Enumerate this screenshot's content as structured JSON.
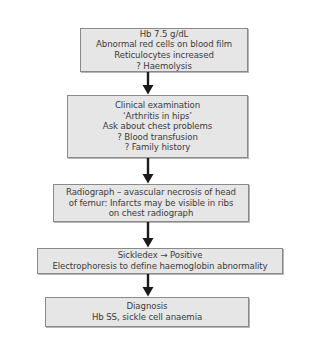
{
  "flowchart": {
    "steps": [
      {
        "id": "initial-findings",
        "lines": [
          "Hb 7.5 g/dL",
          "Abnormal red cells on blood film",
          "Reticulocytes increased",
          "? Haemolysis"
        ]
      },
      {
        "id": "clinical-examination",
        "lines": [
          "Clinical examination",
          "‘Arthritis in hips’",
          "Ask about chest problems",
          "? Blood transfusion",
          "? Family history"
        ]
      },
      {
        "id": "radiograph",
        "lines": [
          "Radiograph – avascular necrosis of head",
          "of femur: Infarcts may be visible in ribs",
          "on chest radiograph"
        ]
      },
      {
        "id": "sickledex",
        "lines": [
          "Sickledex → Positive",
          "Electrophoresis to define haemoglobin abnormality"
        ]
      },
      {
        "id": "diagnosis",
        "lines": [
          "Diagnosis",
          "Hb SS, sickle cell anaemia"
        ]
      }
    ],
    "colors": {
      "box_fill": "#e6e6e6",
      "box_border": "#8a8a8a",
      "text": "#3c3c3c",
      "arrow": "#1a1a1a",
      "background": "#ffffff"
    }
  }
}
